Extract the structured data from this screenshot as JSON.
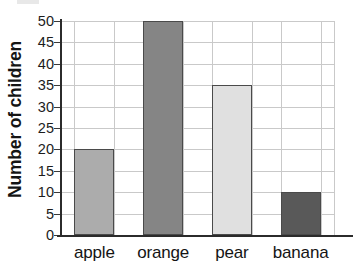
{
  "chart_data": {
    "type": "bar",
    "title": "",
    "subtitle": "",
    "xlabel": "",
    "ylabel": "Number of children",
    "categories": [
      "apple",
      "orange",
      "pear",
      "banana"
    ],
    "values": [
      20,
      50,
      35,
      10
    ],
    "series": [
      {
        "name": "Number of children",
        "values": [
          20,
          50,
          35,
          10
        ]
      }
    ],
    "ylim": [
      0,
      50
    ],
    "y_tick_step": 5,
    "y_ticks": [
      0,
      5,
      10,
      15,
      20,
      25,
      30,
      35,
      40,
      45,
      50
    ],
    "y_tick_labels": [
      "0",
      "5",
      "10",
      "15",
      "20",
      "25",
      "30",
      "35",
      "40",
      "45",
      "50"
    ],
    "grid": true,
    "grid_axis": "both",
    "legend": false,
    "legend_position": "none",
    "bar_colors": [
      "#ACACAC",
      "#858585",
      "#E0E0E0",
      "#595959"
    ],
    "bar_border_color": "#4A4A4A",
    "gridline_color": "#C9C9C9",
    "axis_color": "#2B2B2B",
    "background_color": "#FFFFFF",
    "annotations": []
  },
  "axis": {
    "y_title": "Number of children"
  }
}
